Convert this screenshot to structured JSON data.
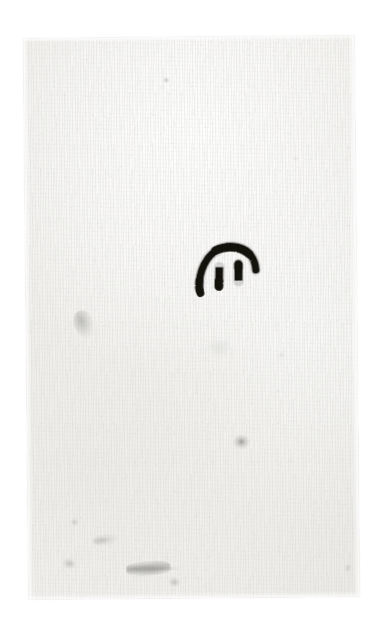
{
  "scene": {
    "title": "Scanned paper sheet with hand-drawn ink mark",
    "background_color": "#ffffff",
    "canvas_width": 377,
    "canvas_height": 628
  },
  "paper": {
    "name": "paper-sheet",
    "description": "Rectangular sheet of textured off-white paper, photographed slightly rotated on a plain white background",
    "base_color": "#f3f2f0",
    "shadow_color": "#c8c8c6",
    "rotation_degrees": -0.55,
    "bounds": {
      "left": 26,
      "top": 37,
      "width": 331,
      "height": 561
    },
    "texture": "fine vertical paper fibre with speckled grain"
  },
  "ink_mark": {
    "name": "ink-arch-glyph",
    "description": "Hand-drawn dark ink mark: a thick arch (inverted U) with two short vertical strokes beneath it, resembling a stylized bridge or lowercase m",
    "ink_color": "#14120f",
    "stroke_style": "thick brush / marker, slightly rough edges",
    "bounds": {
      "left": 194,
      "top": 236,
      "width": 58,
      "height": 56
    },
    "parts": [
      {
        "name": "arch-stroke",
        "shape": "inverted-U arch"
      },
      {
        "name": "left-leg-stroke",
        "shape": "short vertical bar"
      },
      {
        "name": "right-leg-stroke",
        "shape": "short vertical bar"
      }
    ]
  },
  "blemishes": [
    {
      "name": "smudge-upper-left",
      "kind": "graphite smudge",
      "tone": "#787876"
    },
    {
      "name": "smudge-center",
      "kind": "dark speck",
      "tone": "#5f5f5d"
    },
    {
      "name": "speck-top",
      "kind": "faint speck",
      "tone": "#969694"
    },
    {
      "name": "speck-left-lower",
      "kind": "faint speck",
      "tone": "#a0a09e"
    },
    {
      "name": "pencil-cluster-a",
      "kind": "pencil scuff",
      "tone": "#878785"
    },
    {
      "name": "pencil-cluster-b",
      "kind": "pencil scuff",
      "tone": "#8c8c8a"
    },
    {
      "name": "pencil-cluster-c",
      "kind": "pencil scuff",
      "tone": "#6e6e6c"
    },
    {
      "name": "pencil-cluster-d",
      "kind": "pencil scuff",
      "tone": "#878785"
    },
    {
      "name": "pencil-hairline",
      "kind": "faint pencil line",
      "tone": "#a8a8a6"
    },
    {
      "name": "speck-right-lower",
      "kind": "faint speck",
      "tone": "#a5a5a3"
    },
    {
      "name": "speck-mid-right",
      "kind": "faint speck",
      "tone": "#b2b2b0"
    },
    {
      "name": "speck-upper-right",
      "kind": "faint speck",
      "tone": "#b6b6b4"
    },
    {
      "name": "smudge-lower-mid",
      "kind": "soft tonal blotch",
      "tone": "#c8c8c6"
    }
  ]
}
